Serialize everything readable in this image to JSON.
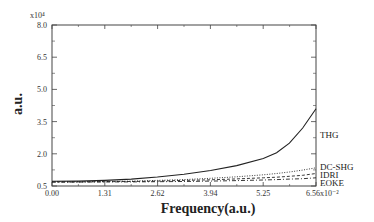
{
  "chart_data": {
    "type": "line",
    "title": "",
    "xlabel": "Frequency(a.u.)",
    "ylabel": "a.u.",
    "y_multiplier": "x10^4",
    "x_multiplier": "x10^-2",
    "xlim": [
      0.0,
      6.56
    ],
    "ylim": [
      0.5,
      8.0
    ],
    "x_ticks": [
      "0.00",
      "1.31",
      "2.62",
      "3.94",
      "5.25",
      "6.56x10⁻²"
    ],
    "y_ticks": [
      "0.5",
      "2.0",
      "3.5",
      "5.0",
      "6.5",
      "8.0"
    ],
    "grid": false,
    "legend_position": "inline labels at right end of curves",
    "x": [
      0.0,
      0.66,
      1.31,
      1.97,
      2.62,
      3.28,
      3.94,
      4.59,
      5.25,
      5.58,
      5.9,
      6.23,
      6.56
    ],
    "series": [
      {
        "name": "THG",
        "style": "solid",
        "values": [
          0.72,
          0.73,
          0.76,
          0.82,
          0.92,
          1.05,
          1.22,
          1.45,
          1.78,
          2.05,
          2.5,
          3.2,
          4.1
        ]
      },
      {
        "name": "DC-SHG",
        "style": "dotted",
        "values": [
          0.7,
          0.7,
          0.71,
          0.73,
          0.76,
          0.8,
          0.86,
          0.93,
          1.02,
          1.08,
          1.15,
          1.24,
          1.35
        ]
      },
      {
        "name": "IDRI",
        "style": "dashed",
        "values": [
          0.69,
          0.69,
          0.7,
          0.71,
          0.73,
          0.76,
          0.79,
          0.83,
          0.88,
          0.91,
          0.95,
          1.0,
          1.08
        ]
      },
      {
        "name": "EOKE",
        "style": "dashdot",
        "values": [
          0.68,
          0.68,
          0.69,
          0.69,
          0.7,
          0.71,
          0.73,
          0.75,
          0.78,
          0.8,
          0.82,
          0.84,
          0.88
        ]
      }
    ]
  },
  "labels": {
    "y_exponent": "x10⁴",
    "x_exponent_tick": "6.56x10⁻²"
  }
}
